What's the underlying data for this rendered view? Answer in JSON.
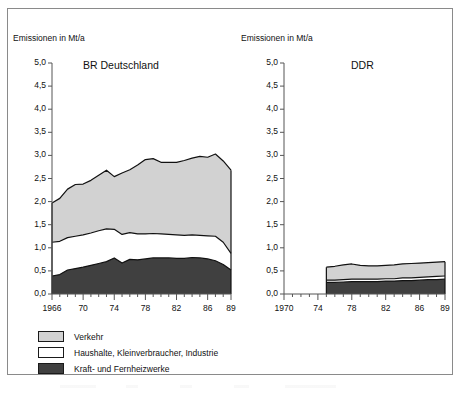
{
  "figure": {
    "axis_title_left": "Emissionen in Mt/a",
    "axis_title_right": "Emissionen in Mt/a",
    "panel_left_title": "BR Deutschland",
    "panel_right_title": "DDR"
  },
  "colors": {
    "verkehr": "#d2d2d2",
    "haushalte": "#ffffff",
    "kraftwerke": "#404040",
    "outline": "#111111",
    "axis": "#555555",
    "frame": "#8a8a8a"
  },
  "legend": {
    "items": [
      {
        "label": "Verkehr",
        "color": "#d2d2d2"
      },
      {
        "label": "Haushalte, Kleinverbraucher, Industrie",
        "color": "#ffffff"
      },
      {
        "label": "Kraft- und Fernheizwerke",
        "color": "#404040"
      }
    ]
  },
  "chart_data": [
    {
      "type": "area",
      "title": "BR Deutschland",
      "stacked": true,
      "ylabel": "Emissionen in Mt/a",
      "xlabel": "",
      "ylim": [
        0,
        5
      ],
      "yticks": [
        0,
        0.5,
        1,
        1.5,
        2,
        2.5,
        3,
        3.5,
        4,
        4.5,
        5
      ],
      "ytick_labels": [
        "0,0",
        "0,5",
        "1,0",
        "1,5",
        "2,0",
        "2,5",
        "3,0",
        "3,5",
        "4,0",
        "4,5",
        "5,0"
      ],
      "xlim": [
        1966,
        1989
      ],
      "xticks_labeled": [
        1966,
        1970,
        1974,
        1978,
        1982,
        1986,
        1989
      ],
      "xtick_labels": [
        "1966",
        "70",
        "74",
        "78",
        "82",
        "86",
        "89"
      ],
      "x": [
        1966,
        1967,
        1968,
        1969,
        1970,
        1971,
        1972,
        1973,
        1974,
        1975,
        1976,
        1977,
        1978,
        1979,
        1980,
        1981,
        1982,
        1983,
        1984,
        1985,
        1986,
        1987,
        1988,
        1989
      ],
      "series": [
        {
          "name": "Kraft- und Fernheizwerke",
          "values": [
            0.39,
            0.42,
            0.52,
            0.55,
            0.58,
            0.62,
            0.66,
            0.7,
            0.78,
            0.67,
            0.75,
            0.74,
            0.76,
            0.78,
            0.78,
            0.78,
            0.77,
            0.77,
            0.79,
            0.78,
            0.76,
            0.72,
            0.64,
            0.52
          ]
        },
        {
          "name": "Haushalte, Kleinverbraucher, Industrie",
          "values": [
            0.73,
            0.72,
            0.7,
            0.7,
            0.7,
            0.7,
            0.71,
            0.71,
            0.62,
            0.62,
            0.58,
            0.56,
            0.54,
            0.53,
            0.52,
            0.51,
            0.51,
            0.5,
            0.49,
            0.49,
            0.5,
            0.53,
            0.48,
            0.36
          ]
        },
        {
          "name": "Verkehr",
          "values": [
            0.85,
            0.93,
            1.05,
            1.12,
            1.1,
            1.14,
            1.2,
            1.27,
            1.14,
            1.33,
            1.36,
            1.49,
            1.61,
            1.62,
            1.55,
            1.56,
            1.57,
            1.62,
            1.66,
            1.71,
            1.7,
            1.78,
            1.76,
            1.8
          ]
        }
      ]
    },
    {
      "type": "area",
      "title": "DDR",
      "stacked": true,
      "ylabel": "Emissionen in Mt/a",
      "xlabel": "",
      "ylim": [
        0,
        5
      ],
      "yticks": [
        0,
        0.5,
        1,
        1.5,
        2,
        2.5,
        3,
        3.5,
        4,
        4.5,
        5
      ],
      "ytick_labels": [
        "0,0",
        "0,5",
        "1,0",
        "1,5",
        "2,0",
        "2,5",
        "3,0",
        "3,5",
        "4,0",
        "4,5",
        "5,0"
      ],
      "xlim": [
        1970,
        1989
      ],
      "xticks_labeled": [
        1970,
        1974,
        1978,
        1982,
        1986,
        1989
      ],
      "xtick_labels": [
        "1970",
        "74",
        "78",
        "82",
        "86",
        "89"
      ],
      "x": [
        1975,
        1976,
        1977,
        1978,
        1979,
        1980,
        1981,
        1982,
        1983,
        1984,
        1985,
        1986,
        1987,
        1988,
        1989
      ],
      "series": [
        {
          "name": "Kraft- und Fernheizwerke",
          "values": [
            0.25,
            0.25,
            0.26,
            0.27,
            0.27,
            0.27,
            0.27,
            0.28,
            0.28,
            0.29,
            0.29,
            0.3,
            0.31,
            0.31,
            0.32
          ]
        },
        {
          "name": "Haushalte, Kleinverbraucher, Industrie",
          "values": [
            0.05,
            0.05,
            0.05,
            0.05,
            0.05,
            0.05,
            0.05,
            0.05,
            0.05,
            0.06,
            0.06,
            0.06,
            0.06,
            0.07,
            0.07
          ]
        },
        {
          "name": "Verkehr",
          "values": [
            0.28,
            0.3,
            0.32,
            0.33,
            0.3,
            0.29,
            0.29,
            0.29,
            0.3,
            0.3,
            0.31,
            0.31,
            0.31,
            0.31,
            0.31
          ]
        }
      ]
    }
  ]
}
